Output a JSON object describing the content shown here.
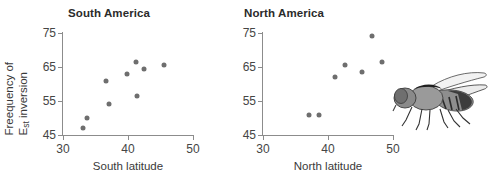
{
  "figure": {
    "ylabel_line1": "Freequency of",
    "ylabel_line2_main": "E",
    "ylabel_line2_sub": "st",
    "ylabel_line2_rest": " inversion",
    "dot_color": "#6e6e6e",
    "axis_color": "#8c8c8c",
    "fly_label": "drosophila-fly-illustration"
  },
  "chart_data": [
    {
      "type": "scatter",
      "title": "South America",
      "xlabel": "South latitude",
      "ylabel": "Freequency of Est inversion",
      "xlim": [
        30,
        50
      ],
      "ylim": [
        45,
        75
      ],
      "xticks": [
        30,
        40,
        50
      ],
      "yticks": [
        45,
        55,
        65,
        75
      ],
      "grid": false,
      "legend": "none",
      "points": [
        {
          "x": 33.1,
          "y": 47.0
        },
        {
          "x": 33.7,
          "y": 50.0
        },
        {
          "x": 36.6,
          "y": 61.0
        },
        {
          "x": 37.1,
          "y": 54.0
        },
        {
          "x": 39.8,
          "y": 63.0
        },
        {
          "x": 41.2,
          "y": 66.5
        },
        {
          "x": 41.4,
          "y": 56.5
        },
        {
          "x": 42.5,
          "y": 64.5
        },
        {
          "x": 45.5,
          "y": 65.5
        }
      ]
    },
    {
      "type": "scatter",
      "title": "North America",
      "xlabel": "North latitude",
      "ylabel": "Freequency of Est inversion",
      "xlim": [
        30,
        50
      ],
      "ylim": [
        45,
        75
      ],
      "xticks": [
        30,
        40,
        50
      ],
      "yticks": [
        45,
        55,
        65,
        75
      ],
      "grid": false,
      "legend": "none",
      "points": [
        {
          "x": 37.0,
          "y": 51.0
        },
        {
          "x": 38.6,
          "y": 51.0
        },
        {
          "x": 41.0,
          "y": 62.0
        },
        {
          "x": 42.6,
          "y": 65.5
        },
        {
          "x": 45.2,
          "y": 63.5
        },
        {
          "x": 46.8,
          "y": 74.0
        },
        {
          "x": 48.3,
          "y": 66.5
        }
      ]
    }
  ]
}
